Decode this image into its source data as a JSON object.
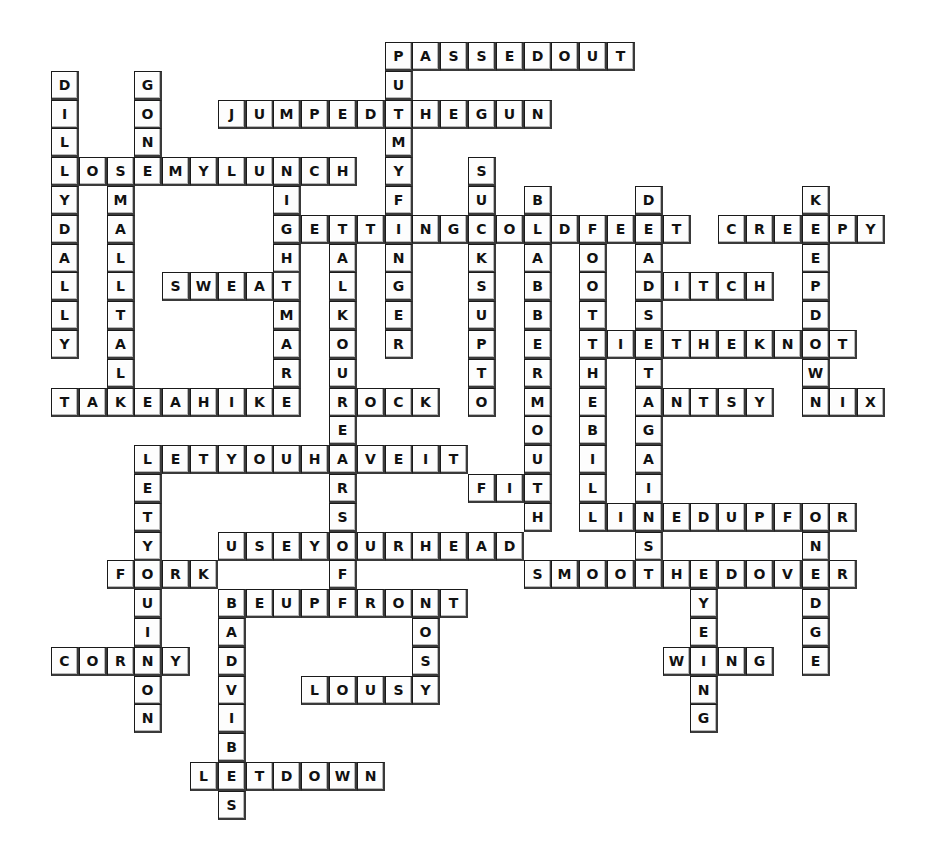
{
  "puzzle": {
    "type": "crossword-filled",
    "grid": {
      "origin_x": 51,
      "origin_y": 42,
      "cell_w": 27.8,
      "cell_h": 28.8,
      "cols": 30,
      "rows": 27
    },
    "colors": {
      "cell_bg": "#fdfdfd",
      "border": "#1a1a1a",
      "letter": "#111111",
      "page_bg": "#ffffff"
    },
    "across": [
      {
        "word": "PASSEDOUT",
        "row": 0,
        "col": 12
      },
      {
        "word": "JUMPEDTHEGUN",
        "row": 2,
        "col": 6
      },
      {
        "word": "LOSEMYLUNCH",
        "row": 4,
        "col": 0
      },
      {
        "word": "GETTINGCOLDFEET",
        "row": 6,
        "col": 8
      },
      {
        "word": "CREEPY",
        "row": 6,
        "col": 24
      },
      {
        "word": "SWEAT",
        "row": 8,
        "col": 4
      },
      {
        "word": "DITCH",
        "row": 8,
        "col": 21
      },
      {
        "word": "TIETHEKNOT",
        "row": 10,
        "col": 19
      },
      {
        "word": "TAKEAHIKE",
        "row": 12,
        "col": 0
      },
      {
        "word": "ROCK",
        "row": 12,
        "col": 10
      },
      {
        "word": "ANTSY",
        "row": 12,
        "col": 21
      },
      {
        "word": "NIX",
        "row": 12,
        "col": 27
      },
      {
        "word": "LETYOUHAVEIT",
        "row": 14,
        "col": 3
      },
      {
        "word": "FIT",
        "row": 15,
        "col": 15
      },
      {
        "word": "LINEDUPFOR",
        "row": 16,
        "col": 19
      },
      {
        "word": "USEYOURHEAD",
        "row": 17,
        "col": 6
      },
      {
        "word": "FORK",
        "row": 18,
        "col": 2
      },
      {
        "word": "SMOOTHEDOVER",
        "row": 18,
        "col": 17
      },
      {
        "word": "BEUPFRONT",
        "row": 19,
        "col": 6
      },
      {
        "word": "CORNY",
        "row": 21,
        "col": 0
      },
      {
        "word": "WING",
        "row": 21,
        "col": 22
      },
      {
        "word": "LOUSY",
        "row": 22,
        "col": 9
      },
      {
        "word": "LETDOWN",
        "row": 25,
        "col": 5
      }
    ],
    "down": [
      {
        "word": "PUTMYFINGER",
        "row": 0,
        "col": 12
      },
      {
        "word": "DILLYDALLY",
        "row": 1,
        "col": 0
      },
      {
        "word": "GONE",
        "row": 1,
        "col": 3
      },
      {
        "word": "SMALLTALK",
        "row": 4,
        "col": 2
      },
      {
        "word": "NIGHTMARE",
        "row": 4,
        "col": 8
      },
      {
        "word": "SUCKSUPTO",
        "row": 4,
        "col": 15
      },
      {
        "word": "BLABBERMOUTH",
        "row": 5,
        "col": 17
      },
      {
        "word": "DEADSETAGAINST",
        "row": 5,
        "col": 21
      },
      {
        "word": "KEEPDOWN",
        "row": 5,
        "col": 27
      },
      {
        "word": "FOOTTHEBILL",
        "row": 6,
        "col": 19
      },
      {
        "word": "TALKOUREARSOFF",
        "row": 6,
        "col": 10
      },
      {
        "word": "LETYOUINON",
        "row": 14,
        "col": 3
      },
      {
        "word": "ONEDGE",
        "row": 16,
        "col": 27
      },
      {
        "word": "EYEING",
        "row": 18,
        "col": 23
      },
      {
        "word": "NOSY",
        "row": 19,
        "col": 13
      },
      {
        "word": "BADVIBES",
        "row": 19,
        "col": 6
      }
    ]
  }
}
